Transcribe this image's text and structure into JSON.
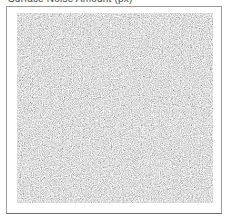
{
  "panel": {
    "title": "Surface Noise Amount (px)"
  },
  "preview": {
    "icon": "noise-texture-preview",
    "description": "grayscale random noise texture",
    "base_color": "#b8b8b8"
  }
}
